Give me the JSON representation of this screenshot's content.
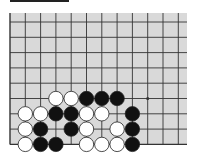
{
  "board": {
    "rows": 9,
    "cols": 12,
    "open_edges": [
      "top",
      "right"
    ],
    "colors": {
      "board": "#d9d9d9",
      "line": "#333333",
      "black": "#111111",
      "white": "#ffffff"
    },
    "star_points": [
      [
        5,
        9
      ]
    ],
    "stones": [
      {
        "row": 5,
        "col": 3,
        "color": "white"
      },
      {
        "row": 5,
        "col": 4,
        "color": "white"
      },
      {
        "row": 5,
        "col": 5,
        "color": "black"
      },
      {
        "row": 5,
        "col": 6,
        "color": "black"
      },
      {
        "row": 5,
        "col": 7,
        "color": "black"
      },
      {
        "row": 6,
        "col": 1,
        "color": "white"
      },
      {
        "row": 6,
        "col": 2,
        "color": "white"
      },
      {
        "row": 6,
        "col": 3,
        "color": "black"
      },
      {
        "row": 6,
        "col": 4,
        "color": "black"
      },
      {
        "row": 6,
        "col": 5,
        "color": "white"
      },
      {
        "row": 6,
        "col": 6,
        "color": "white"
      },
      {
        "row": 6,
        "col": 8,
        "color": "black"
      },
      {
        "row": 7,
        "col": 1,
        "color": "white"
      },
      {
        "row": 7,
        "col": 2,
        "color": "black"
      },
      {
        "row": 7,
        "col": 4,
        "color": "black"
      },
      {
        "row": 7,
        "col": 5,
        "color": "white"
      },
      {
        "row": 7,
        "col": 7,
        "color": "white"
      },
      {
        "row": 7,
        "col": 8,
        "color": "black"
      },
      {
        "row": 8,
        "col": 1,
        "color": "white"
      },
      {
        "row": 8,
        "col": 2,
        "color": "black"
      },
      {
        "row": 8,
        "col": 3,
        "color": "black"
      },
      {
        "row": 8,
        "col": 5,
        "color": "white"
      },
      {
        "row": 8,
        "col": 6,
        "color": "white"
      },
      {
        "row": 8,
        "col": 7,
        "color": "white"
      },
      {
        "row": 8,
        "col": 8,
        "color": "black"
      }
    ]
  }
}
